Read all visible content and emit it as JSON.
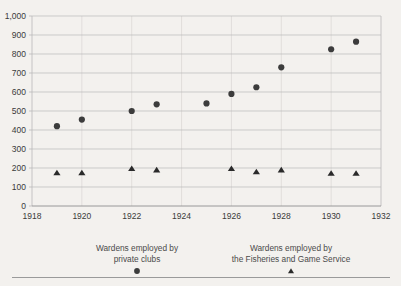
{
  "chart_data": {
    "type": "scatter",
    "title": "",
    "xlabel": "",
    "ylabel": "",
    "xlim": [
      1918,
      1932
    ],
    "ylim": [
      0,
      1000
    ],
    "grid": true,
    "legend_position": "bottom",
    "x_ticks": [
      "1918",
      "1920",
      "1922",
      "1924",
      "1926",
      "1928",
      "1930",
      "1932"
    ],
    "x_tick_values": [
      1918,
      1920,
      1922,
      1924,
      1926,
      1928,
      1930,
      1932
    ],
    "y_ticks": [
      "0",
      "100",
      "200",
      "300",
      "400",
      "500",
      "600",
      "700",
      "800",
      "900",
      "1,000"
    ],
    "y_tick_values": [
      0,
      100,
      200,
      300,
      400,
      500,
      600,
      700,
      800,
      900,
      1000
    ],
    "series": [
      {
        "name": "Wardens employed by private clubs",
        "marker": "circle",
        "color": "#3c3c3c",
        "points": [
          {
            "x": 1919,
            "y": 420
          },
          {
            "x": 1920,
            "y": 455
          },
          {
            "x": 1922,
            "y": 500
          },
          {
            "x": 1923,
            "y": 535
          },
          {
            "x": 1925,
            "y": 540
          },
          {
            "x": 1926,
            "y": 590
          },
          {
            "x": 1927,
            "y": 625
          },
          {
            "x": 1928,
            "y": 730
          },
          {
            "x": 1930,
            "y": 825
          },
          {
            "x": 1931,
            "y": 865
          }
        ]
      },
      {
        "name": "Wardens employed by the Fisheries and Game Service",
        "marker": "triangle",
        "color": "#2a2a2a",
        "points": [
          {
            "x": 1919,
            "y": 175
          },
          {
            "x": 1920,
            "y": 175
          },
          {
            "x": 1922,
            "y": 197
          },
          {
            "x": 1923,
            "y": 190
          },
          {
            "x": 1926,
            "y": 197
          },
          {
            "x": 1927,
            "y": 180
          },
          {
            "x": 1928,
            "y": 190
          },
          {
            "x": 1930,
            "y": 172
          },
          {
            "x": 1931,
            "y": 172
          }
        ]
      }
    ]
  },
  "legend": {
    "clubs": {
      "line1": "Wardens employed by",
      "line2": "private clubs",
      "marker": "circle-marker"
    },
    "service": {
      "line1": "Wardens employed by",
      "line2": "the Fisheries and Game Service",
      "marker": "triangle-marker"
    }
  },
  "colors": {
    "background": "#f3f1ee",
    "grid": "#b9b9b9",
    "vgrid": "#d8d6d3",
    "axis": "#8f8f8f",
    "series_circle": "#3c3c3c",
    "series_triangle": "#2a2a2a",
    "text": "#3a3a3a"
  }
}
